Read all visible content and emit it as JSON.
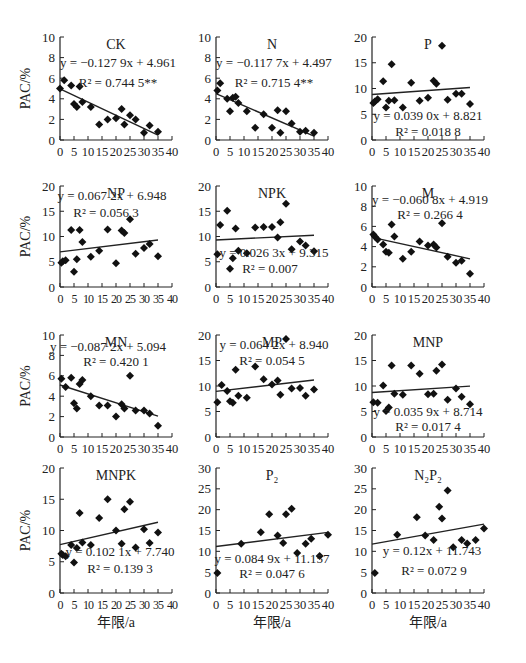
{
  "figure": {
    "ylabel": "PAC/%",
    "xlabel": "年限/a"
  },
  "chart_data": [
    {
      "type": "scatter",
      "title": "CK",
      "equation": "y = −0.127 9x + 4.961",
      "r2": "R² = 0.744 5**",
      "slope": -0.1279,
      "intercept": 4.961,
      "xlim": [
        0,
        40
      ],
      "ylim": [
        0,
        10
      ],
      "xticks": [
        0,
        5,
        10,
        15,
        20,
        25,
        30,
        35,
        40
      ],
      "yticks": [
        0,
        2,
        4,
        6,
        8,
        10
      ],
      "ylabel": "PAC/%",
      "xlabel": "",
      "fit_range": [
        0,
        35
      ],
      "points": [
        [
          0,
          5.0
        ],
        [
          1.5,
          5.8
        ],
        [
          4,
          5.3
        ],
        [
          5,
          3.5
        ],
        [
          6,
          3.2
        ],
        [
          7,
          5.2
        ],
        [
          8,
          3.7
        ],
        [
          11,
          3.2
        ],
        [
          14,
          1.5
        ],
        [
          17,
          2.0
        ],
        [
          20,
          2.1
        ],
        [
          22,
          3.0
        ],
        [
          23,
          1.5
        ],
        [
          25,
          2.4
        ],
        [
          27,
          2.0
        ],
        [
          30,
          0.7
        ],
        [
          32,
          1.4
        ],
        [
          35,
          0.8
        ]
      ]
    },
    {
      "type": "scatter",
      "title": "N",
      "equation": "y = −0.117 7x + 4.497",
      "r2": "R² = 0.715 4**",
      "slope": -0.1177,
      "intercept": 4.497,
      "xlim": [
        0,
        40
      ],
      "ylim": [
        0,
        10
      ],
      "xticks": [
        0,
        5,
        10,
        15,
        20,
        25,
        30,
        35,
        40
      ],
      "yticks": [
        0,
        2,
        4,
        6,
        8,
        10
      ],
      "ylabel": "",
      "xlabel": "",
      "fit_range": [
        0,
        35
      ],
      "points": [
        [
          0.5,
          4.8
        ],
        [
          1.5,
          5.5
        ],
        [
          4,
          4.0
        ],
        [
          5,
          2.8
        ],
        [
          6,
          4.1
        ],
        [
          7,
          4.2
        ],
        [
          8,
          3.6
        ],
        [
          11,
          2.8
        ],
        [
          14,
          1.2
        ],
        [
          17,
          2.5
        ],
        [
          20,
          1.2
        ],
        [
          22,
          2.9
        ],
        [
          23,
          0.7
        ],
        [
          25,
          2.8
        ],
        [
          27,
          1.6
        ],
        [
          30,
          0.8
        ],
        [
          32,
          0.9
        ],
        [
          35,
          0.7
        ]
      ]
    },
    {
      "type": "scatter",
      "title": "P",
      "equation": "y = 0.039 0x + 8.821",
      "r2": "R² = 0.018 8",
      "slope": 0.039,
      "intercept": 8.821,
      "xlim": [
        0,
        40
      ],
      "ylim": [
        0,
        20
      ],
      "xticks": [
        0,
        5,
        10,
        15,
        20,
        25,
        30,
        35,
        40
      ],
      "yticks": [
        0,
        5,
        10,
        15,
        20
      ],
      "ylabel": "",
      "xlabel": "",
      "fit_range": [
        0,
        35
      ],
      "points": [
        [
          0.5,
          7.2
        ],
        [
          1,
          7.5
        ],
        [
          2,
          7.9
        ],
        [
          4,
          11.4
        ],
        [
          5,
          6.3
        ],
        [
          6,
          7.6
        ],
        [
          7,
          14.7
        ],
        [
          8,
          7.7
        ],
        [
          11,
          6.3
        ],
        [
          14,
          11.1
        ],
        [
          17,
          7.6
        ],
        [
          20,
          8.2
        ],
        [
          22,
          11.5
        ],
        [
          23,
          10.9
        ],
        [
          25,
          18.3
        ],
        [
          27,
          7.8
        ],
        [
          30,
          9.0
        ],
        [
          32,
          9.0
        ],
        [
          35,
          7.0
        ]
      ]
    },
    {
      "type": "scatter",
      "title": "NP",
      "equation": "y = 0.067 2x + 6.948",
      "r2": "R² = 0.056 3",
      "slope": 0.0672,
      "intercept": 6.948,
      "xlim": [
        0,
        40
      ],
      "ylim": [
        0,
        20
      ],
      "xticks": [
        0,
        5,
        10,
        15,
        20,
        25,
        30,
        35,
        40
      ],
      "yticks": [
        0,
        5,
        10,
        15,
        20
      ],
      "ylabel": "PAC/%",
      "xlabel": "",
      "fit_range": [
        0,
        35
      ],
      "tight_ticks": true,
      "points": [
        [
          0.5,
          4.8
        ],
        [
          1,
          5.1
        ],
        [
          2,
          5.3
        ],
        [
          4,
          11.3
        ],
        [
          5,
          3.0
        ],
        [
          6,
          5.5
        ],
        [
          7,
          11.3
        ],
        [
          8,
          8.9
        ],
        [
          11,
          6.0
        ],
        [
          14,
          7.2
        ],
        [
          17,
          11.4
        ],
        [
          20,
          4.7
        ],
        [
          22,
          11.2
        ],
        [
          23,
          10.7
        ],
        [
          25,
          13.4
        ],
        [
          27,
          6.6
        ],
        [
          30,
          7.7
        ],
        [
          32,
          8.5
        ],
        [
          35,
          6.1
        ]
      ]
    },
    {
      "type": "scatter",
      "title": "NPK",
      "equation": "y = 0.026 3x + 9.315",
      "r2": "R² = 0.007",
      "slope": 0.0263,
      "intercept": 9.315,
      "xlim": [
        0,
        40
      ],
      "ylim": [
        0,
        20
      ],
      "xticks": [
        0,
        5,
        10,
        15,
        20,
        25,
        30,
        35,
        40
      ],
      "yticks": [
        0,
        5,
        10,
        15,
        20
      ],
      "ylabel": "",
      "xlabel": "",
      "fit_range": [
        0,
        35
      ],
      "points": [
        [
          0.5,
          6.5
        ],
        [
          1.5,
          12.3
        ],
        [
          4,
          15.1
        ],
        [
          5,
          3.6
        ],
        [
          6,
          5.7
        ],
        [
          7,
          11.6
        ],
        [
          8,
          7.2
        ],
        [
          11,
          6.7
        ],
        [
          14,
          11.8
        ],
        [
          17,
          11.9
        ],
        [
          20,
          11.9
        ],
        [
          22,
          9.8
        ],
        [
          23,
          12.8
        ],
        [
          25,
          16.5
        ],
        [
          27,
          7.5
        ],
        [
          30,
          9.0
        ],
        [
          32,
          8.2
        ],
        [
          35,
          7.1
        ]
      ]
    },
    {
      "type": "scatter",
      "title": "M",
      "equation": "y = −0.060 8x + 4.919",
      "r2": "R² = 0.266 4",
      "slope": -0.0608,
      "intercept": 4.919,
      "xlim": [
        0,
        40
      ],
      "ylim": [
        0,
        10
      ],
      "xticks": [
        0,
        5,
        10,
        15,
        20,
        25,
        30,
        35,
        40
      ],
      "yticks": [
        0,
        2,
        4,
        6,
        8,
        10
      ],
      "ylabel": "",
      "xlabel": "",
      "fit_range": [
        0,
        35
      ],
      "points": [
        [
          0.5,
          5.2
        ],
        [
          1,
          5.0
        ],
        [
          2,
          4.7
        ],
        [
          4,
          4.2
        ],
        [
          5,
          3.5
        ],
        [
          6,
          3.4
        ],
        [
          7,
          6.2
        ],
        [
          8,
          5.0
        ],
        [
          11,
          2.8
        ],
        [
          14,
          3.5
        ],
        [
          17,
          4.5
        ],
        [
          20,
          4.1
        ],
        [
          22,
          4.2
        ],
        [
          23,
          3.9
        ],
        [
          25,
          6.3
        ],
        [
          27,
          3.0
        ],
        [
          30,
          2.4
        ],
        [
          32,
          2.6
        ],
        [
          35,
          1.3
        ]
      ]
    },
    {
      "type": "scatter",
      "title": "MN",
      "equation": "y = −0.087 2x + 5.094",
      "r2": "R² = 0.420 1",
      "slope": -0.0872,
      "intercept": 5.094,
      "xlim": [
        0,
        40
      ],
      "ylim": [
        0,
        10
      ],
      "xticks": [
        0,
        5,
        10,
        15,
        20,
        25,
        30,
        35,
        40
      ],
      "yticks": [
        0,
        2,
        4,
        6,
        8,
        10
      ],
      "ylabel": "PAC/%",
      "xlabel": "",
      "fit_range": [
        0,
        35
      ],
      "points": [
        [
          0.5,
          5.7
        ],
        [
          2,
          4.9
        ],
        [
          4,
          5.8
        ],
        [
          5,
          3.3
        ],
        [
          6,
          2.8
        ],
        [
          7,
          5.2
        ],
        [
          8,
          5.6
        ],
        [
          11,
          4.0
        ],
        [
          14,
          3.1
        ],
        [
          17,
          3.1
        ],
        [
          20,
          2.0
        ],
        [
          22,
          3.2
        ],
        [
          23,
          2.8
        ],
        [
          25,
          6.0
        ],
        [
          27,
          2.6
        ],
        [
          30,
          2.6
        ],
        [
          32,
          2.3
        ],
        [
          35,
          1.1
        ]
      ]
    },
    {
      "type": "scatter",
      "title": "MP",
      "equation": "y = 0.064 2x + 8.940",
      "r2": "R² = 0.054 5",
      "slope": 0.0642,
      "intercept": 8.94,
      "xlim": [
        0,
        40
      ],
      "ylim": [
        0,
        20
      ],
      "xticks": [
        0,
        5,
        10,
        15,
        20,
        25,
        30,
        35,
        40
      ],
      "yticks": [
        0,
        5,
        10,
        15,
        20
      ],
      "ylabel": "",
      "xlabel": "",
      "fit_range": [
        0,
        35
      ],
      "points": [
        [
          0.5,
          6.8
        ],
        [
          2,
          10.2
        ],
        [
          4,
          9.0
        ],
        [
          5,
          7.0
        ],
        [
          6,
          6.7
        ],
        [
          7,
          13.2
        ],
        [
          8,
          8.1
        ],
        [
          11,
          7.7
        ],
        [
          14,
          13.8
        ],
        [
          17,
          11.3
        ],
        [
          20,
          10.3
        ],
        [
          22,
          11.1
        ],
        [
          23,
          8.3
        ],
        [
          25,
          19.2
        ],
        [
          27,
          9.5
        ],
        [
          30,
          9.6
        ],
        [
          32,
          8.1
        ],
        [
          35,
          9.3
        ]
      ]
    },
    {
      "type": "scatter",
      "title": "MNP",
      "equation": "y = 0.035 9x + 8.714",
      "r2": "R² = 0.017 4",
      "slope": 0.0359,
      "intercept": 8.714,
      "xlim": [
        0,
        40
      ],
      "ylim": [
        0,
        20
      ],
      "xticks": [
        0,
        5,
        10,
        15,
        20,
        25,
        30,
        35,
        40
      ],
      "yticks": [
        0,
        5,
        10,
        15,
        20
      ],
      "ylabel": "",
      "xlabel": "",
      "fit_range": [
        0,
        35
      ],
      "points": [
        [
          0.5,
          6.8
        ],
        [
          2,
          6.7
        ],
        [
          4,
          10.1
        ],
        [
          5,
          5.1
        ],
        [
          6,
          5.8
        ],
        [
          7,
          14.0
        ],
        [
          8,
          8.5
        ],
        [
          11,
          8.3
        ],
        [
          14,
          14.0
        ],
        [
          17,
          12.4
        ],
        [
          20,
          8.4
        ],
        [
          22,
          8.5
        ],
        [
          23,
          13.0
        ],
        [
          25,
          14.2
        ],
        [
          27,
          7.3
        ],
        [
          30,
          9.5
        ],
        [
          32,
          7.9
        ],
        [
          35,
          6.4
        ]
      ]
    },
    {
      "type": "scatter",
      "title": "MNPK",
      "equation": "y = 0.102 1x + 7.740",
      "r2": "R² = 0.139 3",
      "slope": 0.1021,
      "intercept": 7.74,
      "xlim": [
        0,
        40
      ],
      "ylim": [
        0,
        20
      ],
      "xticks": [
        0,
        5,
        10,
        15,
        20,
        25,
        30,
        35,
        40
      ],
      "yticks": [
        0,
        5,
        10,
        15,
        20
      ],
      "ylabel": "PAC/%",
      "xlabel": "年限/a",
      "fit_range": [
        0,
        35
      ],
      "tight_ticks": true,
      "points": [
        [
          0.5,
          6.3
        ],
        [
          1,
          6.1
        ],
        [
          2,
          5.9
        ],
        [
          4,
          7.7
        ],
        [
          5,
          4.9
        ],
        [
          6,
          7.2
        ],
        [
          7,
          12.8
        ],
        [
          8,
          8.1
        ],
        [
          11,
          7.7
        ],
        [
          14,
          12.0
        ],
        [
          17,
          15.0
        ],
        [
          20,
          10.0
        ],
        [
          22,
          7.9
        ],
        [
          23,
          13.4
        ],
        [
          25,
          14.6
        ],
        [
          27,
          7.3
        ],
        [
          30,
          10.2
        ],
        [
          32,
          8.0
        ],
        [
          35,
          9.7
        ]
      ]
    },
    {
      "type": "scatter",
      "title": "P₂",
      "equation": "y = 0.084 9x + 11.157",
      "r2": "R² = 0.047 6",
      "slope": 0.0849,
      "intercept": 11.157,
      "xlim": [
        0,
        40
      ],
      "ylim": [
        0,
        30
      ],
      "xticks": [
        0,
        5,
        10,
        15,
        20,
        25,
        30,
        35,
        40
      ],
      "yticks": [
        0,
        5,
        10,
        15,
        20,
        25,
        30
      ],
      "ylabel": "",
      "xlabel": "年限/a",
      "fit_range": [
        0,
        40
      ],
      "points": [
        [
          0.5,
          4.8
        ],
        [
          9,
          11.8
        ],
        [
          16,
          14.6
        ],
        [
          19,
          18.9
        ],
        [
          22,
          13.8
        ],
        [
          24,
          12.0
        ],
        [
          25,
          18.9
        ],
        [
          27,
          20.2
        ],
        [
          29,
          9.6
        ],
        [
          32,
          11.8
        ],
        [
          34,
          13.0
        ],
        [
          37,
          8.9
        ],
        [
          40,
          14.0
        ]
      ]
    },
    {
      "type": "scatter",
      "title": "N₂P₂",
      "equation": "y = 0.12x + 11.743",
      "r2": "R² = 0.072 9",
      "slope": 0.12,
      "intercept": 11.743,
      "xlim": [
        0,
        40
      ],
      "ylim": [
        0,
        30
      ],
      "xticks": [
        0,
        5,
        10,
        15,
        20,
        25,
        30,
        35,
        40
      ],
      "yticks": [
        0,
        5,
        10,
        15,
        20,
        25,
        30
      ],
      "ylabel": "",
      "xlabel": "年限/a",
      "fit_range": [
        0,
        40
      ],
      "points": [
        [
          1,
          4.8
        ],
        [
          9,
          14.0
        ],
        [
          16,
          18.2
        ],
        [
          19,
          13.8
        ],
        [
          22,
          12.7
        ],
        [
          24,
          20.7
        ],
        [
          25,
          17.9
        ],
        [
          27,
          24.6
        ],
        [
          29,
          11.0
        ],
        [
          32,
          12.7
        ],
        [
          34,
          11.9
        ],
        [
          37,
          12.7
        ],
        [
          40,
          15.5
        ]
      ]
    }
  ]
}
